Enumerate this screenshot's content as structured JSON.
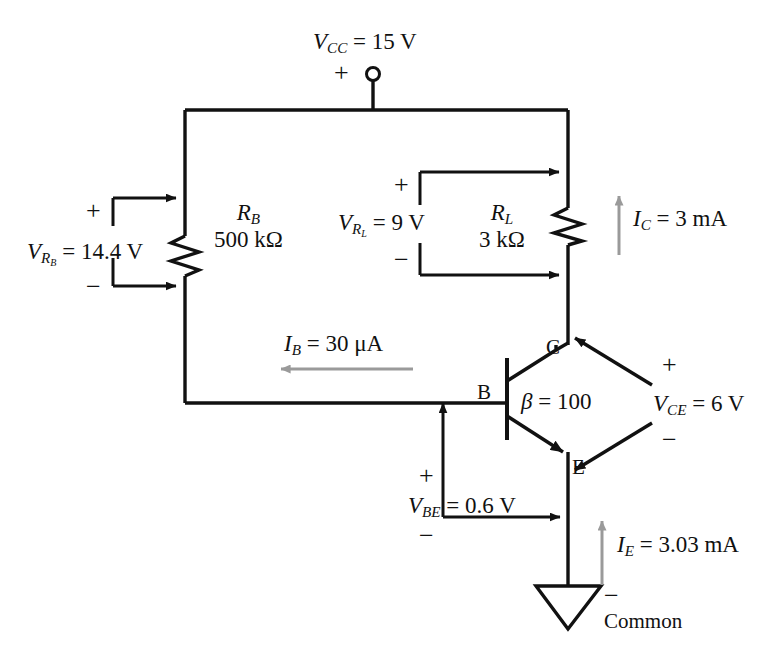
{
  "diagram": {
    "supply": {
      "label_v": "V",
      "label_sub": "CC",
      "label_value": " = 15 V",
      "polarity_plus": "+",
      "terminal": "open-circle-terminal"
    },
    "base_resistor": {
      "name_v": "R",
      "name_sub": "B",
      "value": "500 kΩ",
      "voltage_v": "V",
      "voltage_sub": "R",
      "voltage_sub2": "B",
      "voltage_value": " = 14.4 V",
      "plus": "+",
      "minus": "−"
    },
    "load_resistor": {
      "name_v": "R",
      "name_sub": "L",
      "value": "3 kΩ",
      "voltage_v": "V",
      "voltage_sub": "R",
      "voltage_sub2": "L",
      "voltage_value": " = 9 V",
      "plus": "+",
      "minus": "−"
    },
    "transistor": {
      "beta_symbol": "β",
      "beta_value": " = 100",
      "base_terminal": "B",
      "collector_terminal": "C",
      "emitter_terminal": "E"
    },
    "currents": {
      "base": {
        "sym": "I",
        "sub": "B",
        "value": " = 30 μA",
        "color": "#9a9a9a"
      },
      "collector": {
        "sym": "I",
        "sub": "C",
        "value": " = 3 mA",
        "color": "#9a9a9a"
      },
      "emitter": {
        "sym": "I",
        "sub": "E",
        "value": " = 3.03 mA",
        "color": "#9a9a9a"
      }
    },
    "voltages": {
      "ce": {
        "sym": "V",
        "sub": "CE",
        "value": " = 6 V",
        "plus": "+",
        "minus": "−"
      },
      "be": {
        "sym": "V",
        "sub": "BE",
        "value": " = 0.6 V",
        "plus": "+",
        "minus": "−"
      }
    },
    "ground": {
      "label": "Common",
      "minus": "−",
      "symbol": "common-ground-triangle"
    },
    "colors": {
      "wire": "#111111",
      "current_arrow": "#9a9a9a",
      "background": "#ffffff"
    }
  }
}
